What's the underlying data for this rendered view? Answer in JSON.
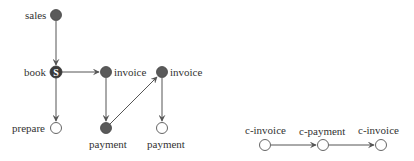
{
  "colors": {
    "filled": "#5a5a5a",
    "edge": "#555555",
    "text": "#333333",
    "empty_fill": "#ffffff"
  },
  "left_graph": {
    "nodes": [
      {
        "id": "sales",
        "label": "sales",
        "x": 56,
        "y": 15,
        "filled": true,
        "label_side": "left"
      },
      {
        "id": "book",
        "label": "book",
        "x": 56,
        "y": 72,
        "filled": true,
        "label_side": "left",
        "marker": "S"
      },
      {
        "id": "invoice1",
        "label": "invoice",
        "x": 106,
        "y": 72,
        "filled": true,
        "label_side": "right"
      },
      {
        "id": "invoice2",
        "label": "invoice",
        "x": 162,
        "y": 72,
        "filled": true,
        "label_side": "right"
      },
      {
        "id": "prepare",
        "label": "prepare",
        "x": 56,
        "y": 128,
        "filled": false,
        "label_side": "left"
      },
      {
        "id": "payment1",
        "label": "payment",
        "x": 106,
        "y": 128,
        "filled": true,
        "label_side": "below"
      },
      {
        "id": "payment2",
        "label": "payment",
        "x": 162,
        "y": 128,
        "filled": false,
        "label_side": "below"
      }
    ],
    "edges": [
      {
        "from": "sales",
        "to": "book"
      },
      {
        "from": "book",
        "to": "invoice1"
      },
      {
        "from": "book",
        "to": "prepare"
      },
      {
        "from": "invoice1",
        "to": "payment1"
      },
      {
        "from": "payment1",
        "to": "invoice2"
      },
      {
        "from": "invoice2",
        "to": "payment2"
      }
    ]
  },
  "right_graph": {
    "nodes": [
      {
        "id": "c-invoice1",
        "label": "c-invoice",
        "x": 265,
        "y": 145,
        "filled": false
      },
      {
        "id": "c-payment",
        "label": "c-payment",
        "x": 323,
        "y": 145,
        "filled": false
      },
      {
        "id": "c-invoice2",
        "label": "c-invoice",
        "x": 381,
        "y": 145,
        "filled": false
      }
    ],
    "edges": [
      {
        "from": "c-invoice1",
        "to": "c-payment"
      },
      {
        "from": "c-payment",
        "to": "c-invoice2"
      }
    ]
  },
  "labels": {
    "sales": "sales",
    "book": "book",
    "book_marker": "S",
    "invoice1": "invoice",
    "invoice2": "invoice",
    "prepare": "prepare",
    "payment1": "payment",
    "payment2": "payment",
    "c_invoice1": "c-invoice",
    "c_payment": "c-payment",
    "c_invoice2": "c-invoice"
  }
}
